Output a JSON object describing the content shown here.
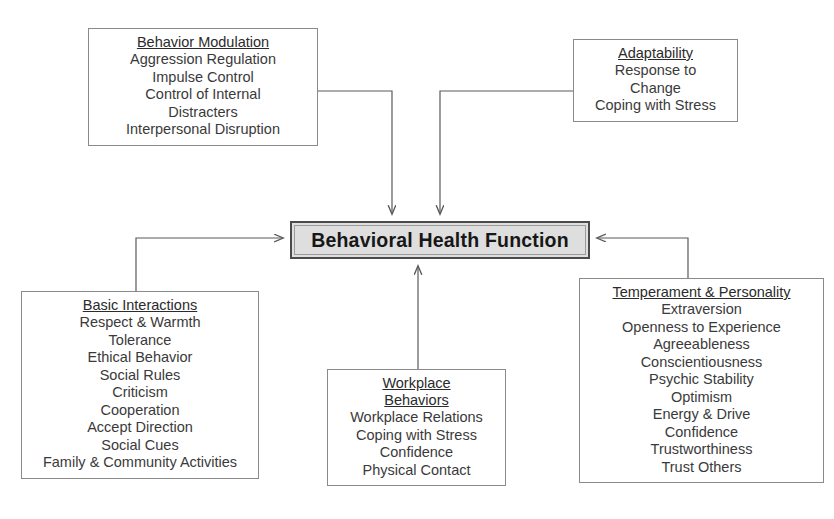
{
  "diagram": {
    "center": {
      "label": "Behavioral Health Function",
      "fill_color": "#dedede",
      "border_color": "#4a4a4a"
    },
    "nodes": [
      {
        "id": "behavior-modulation",
        "title": "Behavior Modulation",
        "items": [
          "Aggression Regulation",
          "Impulse Control",
          "Control of Internal",
          "Distracters",
          "Interpersonal Disruption"
        ]
      },
      {
        "id": "adaptability",
        "title": "Adaptability",
        "items": [
          "Response to",
          "Change",
          "Coping with Stress"
        ]
      },
      {
        "id": "basic-interactions",
        "title": "Basic Interactions",
        "items": [
          "Respect & Warmth",
          "Tolerance",
          "Ethical Behavior",
          "Social Rules",
          "Criticism",
          "Cooperation",
          "Accept Direction",
          "Social Cues",
          "Family & Community Activities"
        ]
      },
      {
        "id": "workplace-behaviors",
        "title": "Workplace",
        "title2": "Behaviors",
        "items": [
          "Workplace Relations",
          "Coping with Stress",
          "Confidence",
          "Physical Contact"
        ]
      },
      {
        "id": "temperament-personality",
        "title": "Temperament & Personality",
        "items": [
          "Extraversion",
          "Openness to Experience",
          "Agreeableness",
          "Conscientiousness",
          "Psychic Stability",
          "Optimism",
          "Energy & Drive",
          "Confidence",
          "Trustworthiness",
          "Trust Others"
        ]
      }
    ],
    "connectors": [
      {
        "id": "behavior-modulation-to-center",
        "from": "behavior-modulation",
        "to": "center",
        "arrow": "down"
      },
      {
        "id": "adaptability-to-center",
        "from": "adaptability",
        "to": "center",
        "arrow": "down"
      },
      {
        "id": "basic-interactions-to-center",
        "from": "basic-interactions",
        "to": "center",
        "arrow": "right"
      },
      {
        "id": "workplace-behaviors-to-center",
        "from": "workplace-behaviors",
        "to": "center",
        "arrow": "up"
      },
      {
        "id": "temperament-personality-to-center",
        "from": "temperament-personality",
        "to": "center",
        "arrow": "left"
      }
    ]
  }
}
